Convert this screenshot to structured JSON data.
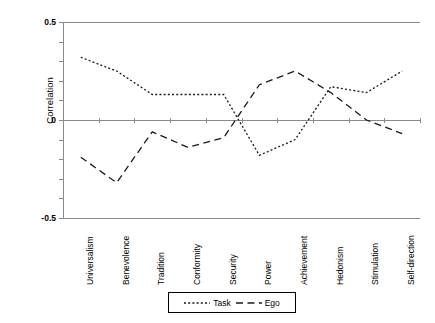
{
  "chart_data": {
    "type": "line",
    "title": "",
    "xlabel": "",
    "ylabel": "Correlation",
    "ylim": [
      -0.5,
      0.5
    ],
    "yticks": [
      "0.5",
      "0",
      "-0.5"
    ],
    "grid": false,
    "legend_position": "bottom-center",
    "categories": [
      "Universalism",
      "Benevolence",
      "Tradition",
      "Conformity",
      "Security",
      "Power",
      "Achievement",
      "Hedonism",
      "Stimulation",
      "Self-direction"
    ],
    "series": [
      {
        "name": "Task",
        "style": "dotted",
        "values": [
          0.32,
          0.25,
          0.13,
          0.13,
          0.13,
          -0.18,
          -0.1,
          0.17,
          0.14,
          0.25
        ]
      },
      {
        "name": "Ego",
        "style": "dashed",
        "values": [
          -0.19,
          -0.32,
          -0.06,
          -0.14,
          -0.09,
          0.18,
          0.25,
          0.14,
          0.0,
          -0.07
        ]
      }
    ]
  },
  "legend": {
    "task_label": "Task",
    "ego_label": "Ego"
  },
  "axis": {
    "y_top": "0.5",
    "y_mid": "0",
    "y_bottom": "-0.5",
    "y_title": "Correlation"
  },
  "colors": {
    "line": "#1a1a1a",
    "axis": "#8a8a8a",
    "background": "#ffffff"
  }
}
